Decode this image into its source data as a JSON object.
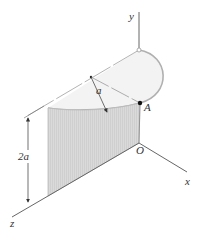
{
  "figure": {
    "labels": {
      "y_axis": "y",
      "x_axis": "x",
      "z_axis": "z",
      "origin": "O",
      "point_a": "A",
      "radius": "a",
      "height": "2a"
    },
    "colors": {
      "axis": "#555555",
      "outline": "#aaaaaa",
      "top_fill": "#f2f2f2",
      "surface_fill": "#d6d6d6",
      "point": "#111111"
    }
  }
}
